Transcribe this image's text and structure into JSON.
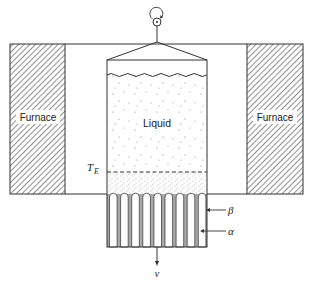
{
  "diagram": {
    "labels": {
      "furnace_left": "Furnace",
      "furnace_right": "Furnace",
      "liquid": "Liquid",
      "eutectic_temp": "T",
      "eutectic_temp_sub": "E",
      "beta_phase": "β",
      "alpha_phase": "α",
      "velocity": "v"
    },
    "icons": {
      "rotation": "rotation-arrow-icon",
      "pull_direction": "down-arrow-icon"
    },
    "colors": {
      "line": "#333333",
      "hatch": "#555555",
      "beta_fill": "#a8a8a8",
      "alpha_fill": "#ffffff",
      "stipple": "#666666"
    },
    "layout": {
      "furnace_left": {
        "x": 10,
        "y": 44,
        "w": 55,
        "h": 150
      },
      "furnace_right": {
        "x": 247,
        "y": 44,
        "w": 56,
        "h": 150
      },
      "crucible": {
        "x": 107,
        "y": 60,
        "w": 100,
        "h": 187
      },
      "liquid_surface_y": 75,
      "eutectic_front_y": 172,
      "hot_cold_boundary_y": 194,
      "lamella_count": 9
    }
  }
}
